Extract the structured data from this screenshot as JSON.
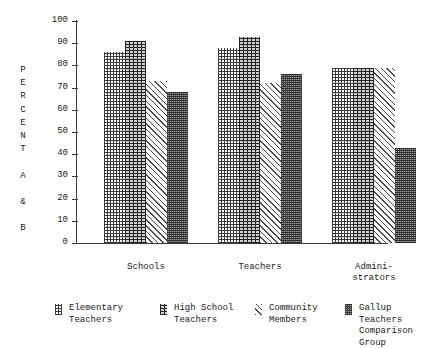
{
  "chart_data": {
    "type": "bar",
    "title": "",
    "subtitle": "",
    "xlabel": "",
    "ylabel": "PERCENT A & B",
    "ylabel_letters": "P\nE\nR\nC\nE\nN\nT\n\nA\n\n&\n\nB",
    "categories": [
      "Schools",
      "Teachers",
      "Admini-\nstrators"
    ],
    "series": [
      {
        "name": "Elementary\nTeachers",
        "legend_line1": "Elementary",
        "legend_line2": "Teachers",
        "pattern": "dotted-grid",
        "values": [
          86,
          88,
          79
        ]
      },
      {
        "name": "High School\nTeachers",
        "legend_line1": "High School",
        "legend_line2": "Teachers",
        "pattern": "dense-crosshatch",
        "values": [
          91,
          93,
          79
        ]
      },
      {
        "name": "Community\nMembers",
        "legend_line1": "Community",
        "legend_line2": "Members",
        "pattern": "diagonal-hatch",
        "values": [
          73,
          72,
          79
        ]
      },
      {
        "name": "Gallup Teachers\nComparison Group",
        "legend_line1": "Gallup Teachers",
        "legend_line2": "Comparison Group",
        "pattern": "fine-stipple",
        "values": [
          68,
          76,
          43
        ]
      }
    ],
    "ylim": [
      0,
      100
    ],
    "ytick_values": [
      0,
      10,
      20,
      30,
      40,
      50,
      60,
      70,
      80,
      90,
      100
    ],
    "ytick_labels": [
      "0",
      "10",
      "20",
      "30",
      "40",
      "50",
      "60",
      "70",
      "80",
      "90",
      "100"
    ],
    "grid": false,
    "legend_position": "bottom",
    "colors": {
      "axis": "#3a3a3a",
      "text": "#1a1a1a",
      "background": "#ffffff"
    }
  }
}
